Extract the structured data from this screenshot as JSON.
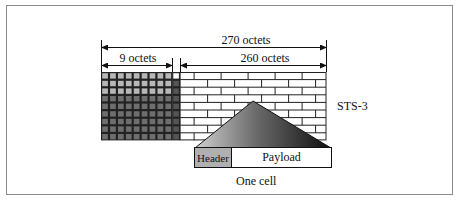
{
  "diagram": {
    "labels": {
      "total_width": "270 octets",
      "overhead_width": "9 octets",
      "payload_width": "260 octets",
      "frame_name": "STS-3",
      "cell_header": "Header",
      "cell_payload": "Payload",
      "cell_caption": "One cell"
    },
    "grid": {
      "overhead_columns": 9,
      "rows": 9,
      "light_rows": 3
    },
    "colors": {
      "overhead_light": "#b8b8b8",
      "overhead_dark": "#6e6e6e",
      "pointer_column": "#555555",
      "grid_line": "#222222",
      "brick_fill": "#ffffff",
      "header_fill": "#b0b0b0",
      "triangle_light": "#cfcfcf",
      "triangle_dark": "#111111"
    }
  }
}
